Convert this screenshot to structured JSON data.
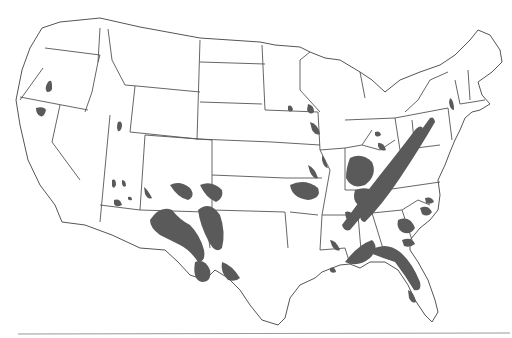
{
  "map": {
    "subject": "Contiguous United States",
    "colors": {
      "background": "#ffffff",
      "border": "#555555",
      "shaded_region": "#5a5a5a",
      "bottom_rule": "#9a9a9a"
    },
    "outline": "M60,22 L100,18 L140,27 L200,38 L260,42 L275,45 L300,47 L310,52 L325,58 L340,60 L360,72 L372,80 L385,92 L400,80 L420,72 L440,65 L455,55 L470,40 L478,30 L490,35 L500,50 L502,62 L492,72 L478,82 L482,95 L490,104 L480,110 L472,112 L465,118 L460,130 L455,140 L450,152 L445,165 L438,180 L440,195 L438,210 L430,220 L420,228 L410,240 L410,250 L418,262 L428,280 L435,300 L438,312 L432,322 L425,315 L415,300 L408,285 L398,270 L385,262 L370,262 L360,268 L350,264 L340,265 L322,272 L315,278 L300,285 L290,298 L285,318 L278,325 L262,320 L250,305 L240,290 L228,278 L215,270 L205,280 L190,275 L178,262 L165,250 L140,248 L112,235 L85,225 L62,222 L55,205 L40,185 L28,160 L20,125 L16,100 L22,70 L30,48 L42,28 Z",
    "state_borders": [
      "M45,48 L100,55 L98,62",
      "M43,68 L20,100",
      "M20,97 L88,110",
      "M100,28 L98,62 L92,92 L85,112",
      "M108,29 L112,60 L125,85 L137,86",
      "M200,40 L197,140",
      "M137,86 L200,92",
      "M135,86 L130,132 L198,139",
      "M60,105 L52,142 L80,180",
      "M110,115 L100,222",
      "M145,135 L140,210 L100,205",
      "M140,210 L205,212",
      "M145,135 L212,140 L212,210",
      "M205,212 L210,248",
      "M200,62 L265,64",
      "M200,102 L262,104",
      "M198,139 L272,142",
      "M212,175 L285,178",
      "M212,210 L285,212 L288,248",
      "M262,45 L265,110",
      "M265,110 L318,112",
      "M272,142 L320,145",
      "M285,178 L322,178",
      "M290,212 L318,215",
      "M318,112 L320,150 L330,170 L322,215",
      "M322,215 L320,250 L345,248 L350,264",
      "M310,52 L300,60 L300,90 L320,112",
      "M320,150 L345,148 L345,190",
      "M345,148 L362,145 L372,130",
      "M345,190 L390,190",
      "M322,215 L358,215 L362,262",
      "M358,215 L372,213 L385,255",
      "M360,72 L365,98",
      "M345,120 L395,118 L400,150",
      "M362,145 L380,150 L395,140",
      "M400,150 L440,145",
      "M385,190 L440,182",
      "M372,213 L402,210 L412,240",
      "M402,210 L418,200 L430,205",
      "M395,118 L448,108",
      "M412,120 L415,150",
      "M405,112 L418,100 L430,80 L448,72",
      "M448,108 L452,140",
      "M455,80 L460,104",
      "M468,70 L470,100",
      "M460,104 L485,100"
    ],
    "shaded_regions": [
      {
        "area": "oregon",
        "d": "M48,82 Q52,78 52,86 Q53,92 47,92 Q44,88 48,82 Z"
      },
      {
        "area": "northern-california",
        "d": "M36,108 Q44,106 46,110 Q44,118 40,116 Q36,114 36,108 Z"
      },
      {
        "area": "utah",
        "d": "M118,122 Q122,120 122,126 Q121,132 118,131 Q116,127 118,122 Z"
      },
      {
        "area": "arizona-north-1",
        "d": "M112,180 Q116,178 116,185 Q114,190 112,186 Z"
      },
      {
        "area": "arizona-north-2",
        "d": "M122,180 Q126,180 126,186 Q123,188 122,184 Z"
      },
      {
        "area": "arizona-central",
        "d": "M114,200 Q120,198 122,205 Q116,208 114,204 Z"
      },
      {
        "area": "arizona-east",
        "d": "M128,197 Q132,196 132,200 Q129,201 128,199 Z"
      },
      {
        "area": "new-mexico-west",
        "d": "M144,187 Q148,190 152,198 Q148,200 145,194 Z"
      },
      {
        "area": "new-mexico-core",
        "d": "M150,220 Q160,205 172,210 Q180,220 190,225 Q200,235 204,250 Q206,262 198,262 Q190,250 180,245 Q170,240 160,235 Q150,228 150,220 Z"
      },
      {
        "area": "new-mexico-north",
        "d": "M170,185 Q180,180 190,188 Q196,196 188,200 Q178,198 170,185 Z"
      },
      {
        "area": "texas-panhandle",
        "d": "M198,210 Q210,200 220,215 Q226,232 222,248 Q215,255 208,240 Q200,225 198,210 Z"
      },
      {
        "area": "oklahoma-west",
        "d": "M200,185 Q212,180 222,190 Q224,198 216,202 Q206,198 200,185 Z"
      },
      {
        "area": "texas-southwest",
        "d": "M195,262 Q205,258 210,270 Q212,282 202,282 Q192,280 195,262 Z"
      },
      {
        "area": "texas-hill-country",
        "d": "M222,262 Q232,265 240,278 Q236,282 228,280 Q220,272 222,262 Z"
      },
      {
        "area": "minnesota-se",
        "d": "M288,106 Q292,104 293,110 Q290,113 288,110 Z"
      },
      {
        "area": "wisconsin-sw",
        "d": "M308,104 Q314,105 314,112 Q310,116 307,110 Z"
      },
      {
        "area": "iowa-east",
        "d": "M310,122 Q318,124 320,134 Q316,136 312,130 Z"
      },
      {
        "area": "missouri-central",
        "d": "M290,185 Q305,178 318,188 Q322,198 308,200 Q292,198 290,185 Z"
      },
      {
        "area": "missouri-east",
        "d": "M308,165 Q315,168 318,178 Q314,180 310,172 Z"
      },
      {
        "area": "illinois-south",
        "d": "M322,155 Q326,160 328,168 Q324,168 322,160 Z"
      },
      {
        "area": "kentucky-tennessee",
        "d": "M350,158 Q362,152 372,162 Q378,175 365,185 Q352,190 346,178 Q346,168 350,158 Z"
      },
      {
        "area": "tennessee-east",
        "d": "M355,190 Q370,185 378,195 Q370,205 358,205 Q352,200 355,190 Z"
      },
      {
        "area": "appalachian-ridge",
        "d": "M342,225 Q360,200 380,175 Q400,150 415,130 Q420,124 423,128 Q410,150 392,178 Q372,205 350,230 Q344,232 342,225 Z"
      },
      {
        "area": "appalachian-valley",
        "d": "M360,215 Q380,195 395,170 Q410,145 430,118 Q434,116 435,122 Q420,148 400,178 Q382,205 365,222 Q360,222 360,215 Z"
      },
      {
        "area": "ohio-north",
        "d": "M375,132 Q380,130 381,135 Q377,138 375,135 Z"
      },
      {
        "area": "ohio-central",
        "d": "M378,143 Q384,142 386,150 Q380,152 378,146 Z"
      },
      {
        "area": "new-york-central",
        "d": "M450,98 Q454,100 454,110 Q450,110 449,102 Z"
      },
      {
        "area": "alabama-south",
        "d": "M345,262 Q358,245 372,240 Q380,248 370,258 Q358,268 345,262 Z"
      },
      {
        "area": "georgia-florida-band",
        "d": "M368,252 Q385,240 400,252 Q412,262 420,282 Q422,292 414,290 Q405,275 395,262 Q382,258 368,252 Z"
      },
      {
        "area": "georgia-central",
        "d": "M398,220 Q410,215 415,228 Q410,236 402,232 Q396,228 398,220 Z"
      },
      {
        "area": "georgia-east",
        "d": "M402,240 Q412,236 415,244 Q410,248 404,246 Z"
      },
      {
        "area": "south-carolina",
        "d": "M420,208 Q428,204 432,212 Q428,218 422,214 Z"
      },
      {
        "area": "north-carolina-coast",
        "d": "M425,198 Q432,196 434,202 Q430,205 426,203 Z"
      },
      {
        "area": "mississippi",
        "d": "M330,240 Q336,240 340,250 Q336,252 332,246 Z"
      },
      {
        "area": "louisiana-delta",
        "d": "M330,268 Q335,266 336,272 Q332,274 330,271 Z"
      },
      {
        "area": "florida-peninsula",
        "d": "M408,290 Q414,292 416,302 Q412,304 409,298 Z"
      },
      {
        "area": "alabama-north",
        "d": "M345,212 Q352,210 354,218 Q350,222 346,218 Z"
      }
    ],
    "bottom_rule": {
      "x1": 18,
      "y1": 334,
      "x2": 510,
      "y2": 333
    }
  }
}
